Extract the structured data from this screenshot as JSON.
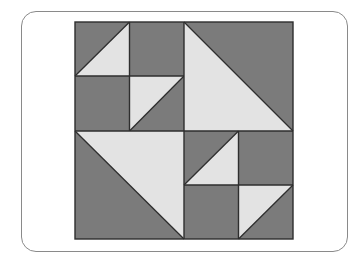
{
  "diagram": {
    "type": "quilt-block",
    "grid": 4,
    "colors": {
      "dark": "#7b7b7b",
      "light": "#e3e3e3",
      "line": "#2e2e2e",
      "card_border": "#8a8a8a",
      "background": "#ffffff"
    },
    "quadrants": [
      {
        "position": "top-left",
        "kind": "four-patch",
        "cells": [
          {
            "position": "top-left",
            "fill": "half-square",
            "light_half": "lower-right",
            "diagonal": "bottom-left-to-top-right"
          },
          {
            "position": "top-right",
            "fill": "dark"
          },
          {
            "position": "bottom-left",
            "fill": "dark"
          },
          {
            "position": "bottom-right",
            "fill": "half-square",
            "light_half": "upper-left",
            "diagonal": "top-right-to-bottom-left"
          }
        ]
      },
      {
        "position": "top-right",
        "kind": "half-square-triangle",
        "light_half": "lower-left",
        "diagonal": "top-left-to-bottom-right"
      },
      {
        "position": "bottom-left",
        "kind": "half-square-triangle",
        "light_half": "upper-right",
        "diagonal": "top-left-to-bottom-right"
      },
      {
        "position": "bottom-right",
        "kind": "four-patch",
        "cells": [
          {
            "position": "top-left",
            "fill": "half-square",
            "light_half": "lower-right",
            "diagonal": "bottom-left-to-top-right"
          },
          {
            "position": "top-right",
            "fill": "dark"
          },
          {
            "position": "bottom-left",
            "fill": "dark"
          },
          {
            "position": "bottom-right",
            "fill": "half-square",
            "light_half": "upper-left",
            "diagonal": "top-right-to-bottom-left"
          }
        ]
      }
    ]
  }
}
